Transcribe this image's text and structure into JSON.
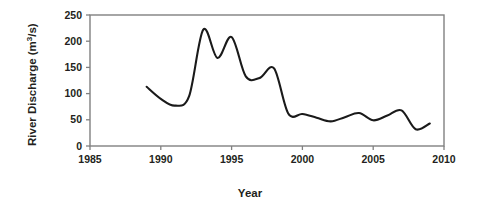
{
  "chart_data": {
    "type": "line",
    "title": "",
    "xlabel": "Year",
    "ylabel": "River Discharge (m³/s)",
    "ylabel_main": "River Discharge (m",
    "ylabel_sup": "3",
    "ylabel_tail": "/s)",
    "xlim": [
      1985,
      2010
    ],
    "ylim": [
      0,
      250
    ],
    "xticks": [
      1985,
      1990,
      1995,
      2000,
      2005,
      2010
    ],
    "xtick_labels": [
      "1985",
      "1990",
      "1995",
      "2000",
      "2005",
      "2010"
    ],
    "yticks": [
      0,
      50,
      100,
      150,
      200,
      250
    ],
    "ytick_labels": [
      "0",
      "50",
      "100",
      "150",
      "200",
      "250"
    ],
    "grid": false,
    "legend": null,
    "line_color": "#1a1a1a",
    "frame_color": "#808080",
    "series": [
      {
        "name": "River Discharge",
        "x": [
          1989,
          1990,
          1991,
          1992,
          1993,
          1994,
          1995,
          1996,
          1997,
          1998,
          1999,
          2000,
          2001,
          2002,
          2003,
          2004,
          2005,
          2006,
          2007,
          2008,
          2009
        ],
        "values": [
          113,
          90,
          77,
          95,
          222,
          168,
          208,
          133,
          130,
          148,
          62,
          61,
          54,
          47,
          55,
          63,
          49,
          58,
          68,
          32,
          43
        ]
      }
    ]
  },
  "axis": {
    "x_title": "Year",
    "y_title": "River Discharge (m3/s)"
  }
}
